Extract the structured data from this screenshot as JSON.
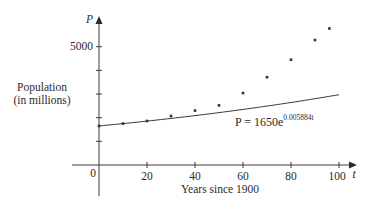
{
  "chart_data": {
    "type": "scatter",
    "title": "",
    "xlabel": "Years since 1900",
    "ylabel": "Population\n(in millions)",
    "x_axis_var": "t",
    "y_axis_var": "P",
    "xlim": [
      0,
      100
    ],
    "ylim": [
      0,
      5000
    ],
    "x_ticks": [
      0,
      20,
      40,
      60,
      80,
      100
    ],
    "x_tick_labels": [
      "0",
      "20",
      "40",
      "60",
      "80",
      "100"
    ],
    "y_ticks": [
      1000,
      2000,
      3000,
      4000,
      5000
    ],
    "y_tick_labels": [
      "",
      "",
      "",
      "",
      "5000"
    ],
    "grid": false,
    "legend": null,
    "series": [
      {
        "name": "Observed population",
        "kind": "scatter",
        "x": [
          0,
          10,
          20,
          30,
          40,
          50,
          60,
          70,
          80,
          90,
          96
        ],
        "y": [
          1650,
          1750,
          1860,
          2070,
          2300,
          2520,
          3040,
          3710,
          4450,
          5280,
          5770
        ]
      },
      {
        "name": "Exponential model",
        "kind": "line",
        "formula": "P = 1650e^(0.005884t)",
        "a": 1650,
        "k": 0.005884,
        "x_range": [
          0,
          100
        ]
      }
    ],
    "annotations": [
      {
        "text_base": "P = 1650e",
        "text_exp": "0.005884t",
        "x": 57,
        "y": 1700
      }
    ]
  },
  "labels": {
    "y_var": "P",
    "x_var": "t",
    "y_title_line1": "Population",
    "y_title_line2": "(in millions)",
    "x_title": "Years since 1900",
    "origin": "0",
    "y_tick_5000": "5000",
    "eq_base": "P = 1650e",
    "eq_exp": "0.005884t"
  }
}
